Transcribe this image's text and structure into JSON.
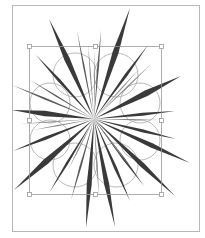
{
  "canvas": {
    "width": 205,
    "height": 238,
    "background": "#ffffff"
  },
  "artboard": {
    "x": 12,
    "y": 5,
    "width": 187,
    "height": 226,
    "stroke": "#b8b8b8"
  },
  "selection": {
    "x": 29,
    "y": 46,
    "width": 132,
    "height": 148,
    "stroke": "#9a9a9a",
    "handles": [
      {
        "name": "handle-top-left",
        "x": 29,
        "y": 46
      },
      {
        "name": "handle-top-center",
        "x": 95,
        "y": 46
      },
      {
        "name": "handle-top-right",
        "x": 161,
        "y": 46
      },
      {
        "name": "handle-middle-left",
        "x": 29,
        "y": 120
      },
      {
        "name": "handle-middle-right",
        "x": 161,
        "y": 120
      },
      {
        "name": "handle-bottom-left",
        "x": 29,
        "y": 194
      },
      {
        "name": "handle-bottom-center",
        "x": 95,
        "y": 194
      },
      {
        "name": "handle-bottom-right",
        "x": 161,
        "y": 194
      }
    ]
  },
  "flower_outline": {
    "stroke": "#a8a8a8",
    "petals": [
      {
        "cx": 75,
        "cy": 75,
        "r": 22
      },
      {
        "cx": 116,
        "cy": 75,
        "r": 22
      },
      {
        "cx": 140,
        "cy": 103,
        "r": 20
      },
      {
        "cx": 140,
        "cy": 140,
        "r": 20
      },
      {
        "cx": 116,
        "cy": 165,
        "r": 22
      },
      {
        "cx": 75,
        "cy": 165,
        "r": 22
      },
      {
        "cx": 50,
        "cy": 140,
        "r": 20
      },
      {
        "cx": 50,
        "cy": 103,
        "r": 20
      }
    ]
  },
  "starburst": {
    "center": {
      "x": 94,
      "y": 119
    },
    "color_dark": "#3a3a3a",
    "color_mid": "#5a5a5a",
    "color_light": "#8a8a8a",
    "spikes": [
      {
        "x": 49,
        "y": 19,
        "w": 5.5,
        "tone": "dark"
      },
      {
        "x": 130,
        "y": 8,
        "w": 6,
        "tone": "dark"
      },
      {
        "x": 77,
        "y": 31,
        "w": 1.6,
        "tone": "mid"
      },
      {
        "x": 101,
        "y": 30,
        "w": 1.8,
        "tone": "mid"
      },
      {
        "x": 88,
        "y": 44,
        "w": 1.2,
        "tone": "light"
      },
      {
        "x": 95,
        "y": 50,
        "w": 1,
        "tone": "light"
      },
      {
        "x": 36,
        "y": 55,
        "w": 3,
        "tone": "dark"
      },
      {
        "x": 30,
        "y": 80,
        "w": 1.4,
        "tone": "mid"
      },
      {
        "x": 12,
        "y": 85,
        "w": 2,
        "tone": "mid"
      },
      {
        "x": 12,
        "y": 110,
        "w": 5.5,
        "tone": "dark"
      },
      {
        "x": 20,
        "y": 124,
        "w": 1.2,
        "tone": "light"
      },
      {
        "x": 148,
        "y": 45,
        "w": 3,
        "tone": "dark"
      },
      {
        "x": 152,
        "y": 63,
        "w": 1.4,
        "tone": "light"
      },
      {
        "x": 140,
        "y": 68,
        "w": 1.2,
        "tone": "light"
      },
      {
        "x": 181,
        "y": 76,
        "w": 6,
        "tone": "dark"
      },
      {
        "x": 175,
        "y": 111,
        "w": 3,
        "tone": "dark"
      },
      {
        "x": 176,
        "y": 139,
        "w": 3,
        "tone": "dark"
      },
      {
        "x": 190,
        "y": 163,
        "w": 4.5,
        "tone": "dark"
      },
      {
        "x": 158,
        "y": 120,
        "w": 1.2,
        "tone": "light"
      },
      {
        "x": 13,
        "y": 151,
        "w": 3.2,
        "tone": "dark"
      },
      {
        "x": 14,
        "y": 190,
        "w": 6,
        "tone": "dark"
      },
      {
        "x": 33,
        "y": 130,
        "w": 1.2,
        "tone": "light"
      },
      {
        "x": 49,
        "y": 193,
        "w": 2.5,
        "tone": "dark"
      },
      {
        "x": 71,
        "y": 200,
        "w": 2,
        "tone": "mid"
      },
      {
        "x": 68,
        "y": 170,
        "w": 1.2,
        "tone": "light"
      },
      {
        "x": 86,
        "y": 228,
        "w": 5,
        "tone": "dark"
      },
      {
        "x": 115,
        "y": 227,
        "w": 5,
        "tone": "dark"
      },
      {
        "x": 99,
        "y": 196,
        "w": 1.4,
        "tone": "light"
      },
      {
        "x": 130,
        "y": 201,
        "w": 3,
        "tone": "dark"
      },
      {
        "x": 144,
        "y": 186,
        "w": 2.4,
        "tone": "dark"
      },
      {
        "x": 131,
        "y": 168,
        "w": 1.2,
        "tone": "light"
      },
      {
        "x": 175,
        "y": 196,
        "w": 5,
        "tone": "dark"
      }
    ]
  }
}
